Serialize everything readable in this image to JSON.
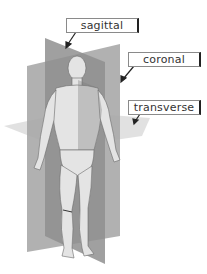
{
  "diagram": {
    "labels": {
      "sagittal": "sagittal",
      "coronal": "coronal",
      "transverse": "transverse"
    },
    "colors": {
      "plane_dark": "#8c8c8c",
      "plane_mid": "#a8a8a8",
      "plane_light": "#d6d6d6",
      "body": "#e2e2e2",
      "label_border": "#8a8a8a",
      "arrow": "#222222"
    }
  }
}
